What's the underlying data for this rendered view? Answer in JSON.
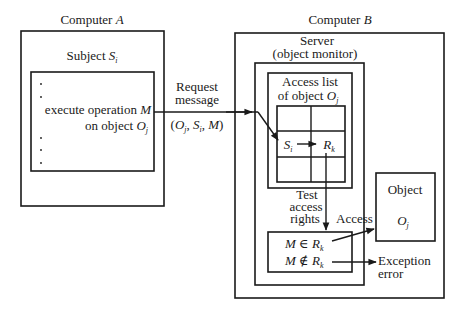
{
  "computer_a": {
    "title": "Computer ",
    "title_var": "A",
    "subject_label": "Subject ",
    "subject_var": "S",
    "subject_sub": "i",
    "op_line1": "execute operation ",
    "op_var": "M",
    "op_line2": "on object ",
    "op_obj": "O",
    "op_obj_sub": "j"
  },
  "request": {
    "line1": "Request",
    "line2": "message",
    "tuple_open": "(",
    "tuple_o": "O",
    "tuple_o_sub": "j",
    "tuple_sep1": ", ",
    "tuple_s": "S",
    "tuple_s_sub": "i",
    "tuple_sep2": ", ",
    "tuple_m": "M",
    "tuple_close": ")"
  },
  "computer_b": {
    "title": "Computer ",
    "title_var": "B",
    "server_line1": "Server",
    "server_line2": "(object monitor)",
    "access_list_line1": "Access list",
    "access_list_line2": "of object ",
    "access_list_obj": "O",
    "access_list_obj_sub": "j",
    "cell_subject": "S",
    "cell_subject_sub": "i",
    "cell_rights": "R",
    "cell_rights_sub": "k",
    "test_line1": "Test",
    "test_line2": "access",
    "test_line3": "rights",
    "cond_in_m": "M",
    "cond_in_op": " ∈ ",
    "cond_in_r": "R",
    "cond_in_sub": "k",
    "cond_notin_m": "M",
    "cond_notin_op": " ∉ ",
    "cond_notin_r": "R",
    "cond_notin_sub": "k",
    "access_label": "Access",
    "object_label": "Object",
    "object_var": "O",
    "object_sub": "j",
    "exception_line1": "Exception",
    "exception_line2": "error"
  }
}
